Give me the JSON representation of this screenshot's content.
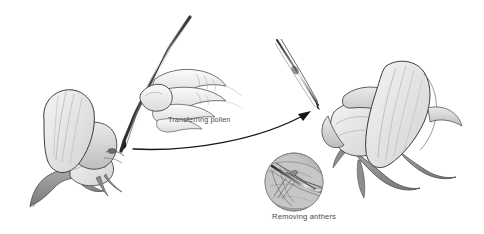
{
  "figure": {
    "title_caption": "",
    "background_color": "#ffffff",
    "ink_color": "#3c3c3c",
    "shade_color": "#9a9a9a",
    "text_color": "#4a4a4a",
    "style": "pencil-line-drawing"
  },
  "labels": {
    "transferring_pollen": "Transferring pollen",
    "removing_anthers": "Removing anthers"
  },
  "elements": {
    "left_flower": {
      "name": "pea-flower-recipient",
      "position": "left",
      "description": "pea flower with standard petal, keel and bracts"
    },
    "right_flower": {
      "name": "pea-flower-donor",
      "position": "right",
      "description": "pea flower facing left with large standard petal"
    },
    "hand": {
      "name": "hand-holding-forceps",
      "description": "hand gripping forceps in pencil grip"
    },
    "large_forceps": {
      "name": "forceps-large",
      "description": "long forceps held by hand, tip at left flower"
    },
    "small_forceps": {
      "name": "forceps-small",
      "description": "second forceps near right flower"
    },
    "inset": {
      "name": "magnified-inset-circle",
      "description": "circular magnified view of forceps removing anthers"
    },
    "arrow": {
      "name": "pollen-transfer-arrow",
      "direction": "left-to-right",
      "description": "curved arrow from left flower to right flower"
    }
  }
}
